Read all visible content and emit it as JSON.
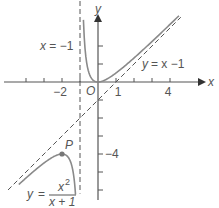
{
  "chart_data": {
    "type": "line",
    "title": "",
    "xlabel": "x",
    "ylabel": "y",
    "xlim": [
      -5.4,
      5.2
    ],
    "ylim": [
      -6.9,
      4.6
    ],
    "x_ticks": [
      -4,
      -3,
      -2,
      -1,
      1,
      2,
      3,
      4
    ],
    "x_tick_labels": [
      {
        "value": -2,
        "text": "−2"
      },
      {
        "value": 1,
        "text": "1"
      },
      {
        "value": 4,
        "text": "4"
      }
    ],
    "y_ticks": [
      2,
      1,
      -1,
      -2,
      -3,
      -4,
      -5,
      -6
    ],
    "y_tick_labels": [
      {
        "value": -4,
        "text": "−4"
      }
    ],
    "origin_label": "O",
    "series": [
      {
        "name": "y = x²/(x+1)",
        "function": "x^2/(x+1)",
        "branches": [
          {
            "x_range": [
              -0.81,
              4.5
            ]
          },
          {
            "x_range": [
              -4.4,
              -1.25
            ]
          }
        ]
      }
    ],
    "asymptotes": [
      {
        "name": "vertical",
        "equation": "x = -1",
        "x": -1,
        "y_range": [
          -6.2,
          4.5
        ]
      },
      {
        "name": "oblique",
        "equation": "y = x - 1",
        "slope": 1,
        "intercept": -1,
        "x_range": [
          -5.0,
          4.6
        ]
      }
    ],
    "points": [
      {
        "label": "P",
        "x": -2,
        "y": -4
      }
    ],
    "annotations": {
      "vertical_asymptote_label": "x = −1",
      "oblique_asymptote_label_lhs": "y",
      "oblique_asymptote_label_rhs": "= x −1",
      "curve_label_lhs": "y",
      "curve_label_eq": "=",
      "curve_label_num": "x",
      "curve_label_num_sup": "2",
      "curve_label_den": "x + 1"
    },
    "grid": false,
    "legend": "none"
  }
}
